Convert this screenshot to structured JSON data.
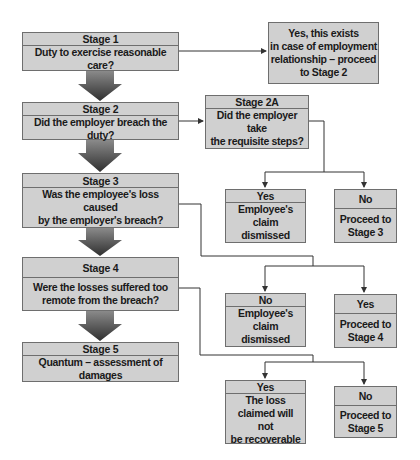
{
  "colors": {
    "box_fill": "#d0d0d0",
    "box_border": "#6e6e6e",
    "line": "#333333",
    "arrow_fill": "#444444"
  },
  "stages": [
    {
      "id": "stage1",
      "title": "Stage 1",
      "question": "Duty to exercise reasonable care?"
    },
    {
      "id": "stage2",
      "title": "Stage 2",
      "question": "Did the employer breach the duty?"
    },
    {
      "id": "stage3",
      "title": "Stage 3",
      "question": "Was the employee's loss caused\nby the employer's breach?"
    },
    {
      "id": "stage4",
      "title": "Stage 4",
      "question": "Were the losses suffered too\nremote from the breach?"
    },
    {
      "id": "stage5",
      "title": "Stage 5",
      "question": "Quantum – assessment of damages"
    }
  ],
  "stage1_outcome": "Yes, this exists\nin case of employment\nrelationship – proceed\nto Stage 2",
  "stage2a": {
    "title": "Stage 2A",
    "question": "Did the employer take\nthe requisite steps?"
  },
  "outcomes": {
    "stage2a_left": {
      "label": "Yes",
      "text": "Employee's\nclaim dismissed"
    },
    "stage2a_right": {
      "label": "No",
      "text": "Proceed to\nStage 3"
    },
    "stage3_left": {
      "label": "No",
      "text": "Employee's\nclaim dismissed"
    },
    "stage3_right": {
      "label": "Yes",
      "text": "Proceed to\nStage 4"
    },
    "stage4_left": {
      "label": "Yes",
      "text": "The loss\nclaimed will not\nbe recoverable"
    },
    "stage4_right": {
      "label": "No",
      "text": "Proceed to\nStage 5"
    }
  }
}
